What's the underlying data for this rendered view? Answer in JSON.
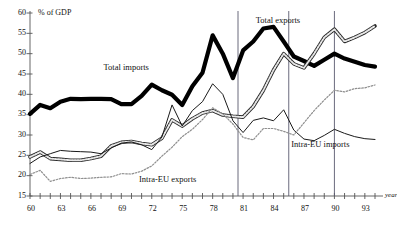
{
  "chart_data": {
    "type": "line",
    "title": "",
    "xlabel": "year",
    "ylabel": "% of GDP",
    "xlim": [
      60,
      94
    ],
    "ylim": [
      15,
      60
    ],
    "ytick_step": 5,
    "xtick_step": 1,
    "xtick_label_step": 3,
    "grid": false,
    "legend_position": "inline-annotations",
    "yticks": [
      15,
      20,
      25,
      30,
      35,
      40,
      45,
      50,
      55,
      60
    ],
    "ytick_labels": [
      "15",
      "20",
      "25",
      "30",
      "35",
      "40",
      "45",
      "50",
      "55",
      "60"
    ],
    "xticks": [
      60,
      63,
      66,
      69,
      72,
      75,
      78,
      81,
      84,
      87,
      90,
      93
    ],
    "xtick_labels": [
      "60",
      "63",
      "66",
      "69",
      "72",
      "75",
      "78",
      "81",
      "84",
      "87",
      "90",
      "93"
    ],
    "vertical_reference_lines": [
      1980.5,
      1985.5,
      1990.0
    ],
    "x": [
      60,
      61,
      62,
      63,
      64,
      65,
      66,
      67,
      68,
      69,
      70,
      71,
      72,
      73,
      74,
      75,
      76,
      77,
      78,
      79,
      80,
      81,
      82,
      83,
      84,
      85,
      86,
      87,
      88,
      89,
      90,
      91,
      92,
      93,
      94
    ],
    "series": [
      {
        "name": "Total imports",
        "style": "thick-solid-black",
        "color": "#000000",
        "label_x": 70.0,
        "label_y": 46.5,
        "values": [
          35.2,
          37.4,
          36.6,
          38.2,
          38.9,
          38.8,
          38.9,
          38.9,
          38.8,
          37.6,
          37.6,
          39.6,
          42.4,
          41.0,
          39.9,
          37.4,
          42.0,
          45.3,
          54.5,
          50.0,
          44.0,
          50.8,
          53.0,
          56.2,
          56.6,
          53.0,
          49.3,
          48.2,
          47.0,
          48.5,
          50.0,
          48.8,
          48.0,
          47.2,
          46.8
        ]
      },
      {
        "name": "Total exports",
        "style": "hatched-gray",
        "color": "#8a8a8a",
        "label_x": 85.0,
        "label_y": 58.0,
        "values": [
          24.6,
          25.8,
          24.2,
          24.0,
          23.8,
          23.8,
          24.2,
          24.8,
          27.3,
          28.2,
          28.4,
          27.9,
          27.6,
          29.2,
          33.7,
          32.2,
          34.0,
          35.4,
          36.0,
          34.9,
          34.6,
          34.4,
          37.0,
          41.0,
          46.0,
          50.0,
          47.5,
          46.5,
          50.0,
          54.0,
          56.0,
          53.0,
          54.0,
          55.2,
          56.8
        ]
      },
      {
        "name": "Intra-EU imports",
        "style": "thin-solid-black",
        "color": "#1a1a1a",
        "label_x": 88.5,
        "label_y": 27.5,
        "values": [
          23.0,
          24.6,
          25.4,
          26.2,
          26.0,
          25.9,
          25.8,
          25.4,
          26.8,
          28.0,
          28.3,
          27.6,
          26.4,
          29.5,
          37.4,
          32.2,
          36.0,
          38.2,
          42.6,
          40.0,
          33.5,
          30.6,
          33.6,
          34.2,
          33.5,
          36.2,
          31.2,
          29.0,
          28.6,
          29.9,
          31.4,
          30.4,
          29.6,
          29.1,
          28.9
        ]
      },
      {
        "name": "Intra-EU exports",
        "style": "dotted-gray",
        "color": "#999999",
        "label_x": 73.5,
        "label_y": 19.0,
        "values": [
          20.3,
          21.3,
          18.6,
          19.3,
          19.6,
          19.3,
          19.4,
          19.6,
          19.7,
          20.5,
          20.4,
          21.1,
          22.4,
          24.8,
          27.0,
          29.6,
          31.4,
          33.8,
          36.7,
          35.2,
          32.7,
          29.4,
          28.8,
          31.6,
          31.6,
          30.9,
          30.0,
          33.0,
          36.0,
          38.6,
          41.0,
          40.6,
          41.4,
          41.6,
          42.3
        ]
      }
    ]
  },
  "axis": {
    "y_unit_label": "% of GDP",
    "x_unit_label": "year"
  }
}
